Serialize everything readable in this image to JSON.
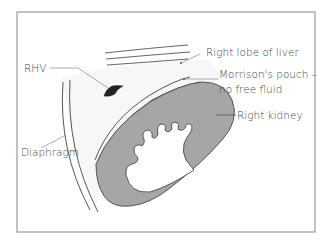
{
  "diagram": {
    "labels": {
      "rhv": "RHV",
      "right_lobe_of_liver": "Right lobe of liver",
      "morrisons_pouch_line1": "Morrison's pouch –",
      "morrisons_pouch_line2": "no free fluid",
      "right_kidney": "Right kidney",
      "diaphragm": "Diaphragm"
    },
    "colors": {
      "frame": "#9a9a9a",
      "kidney_fill": "#a6a6a6",
      "kidney_outline": "#555555",
      "liver_fill": "#f7f7f7",
      "rhv_fill": "#222222",
      "line": "#666666",
      "leader": "#888888",
      "text": "#444444"
    }
  }
}
